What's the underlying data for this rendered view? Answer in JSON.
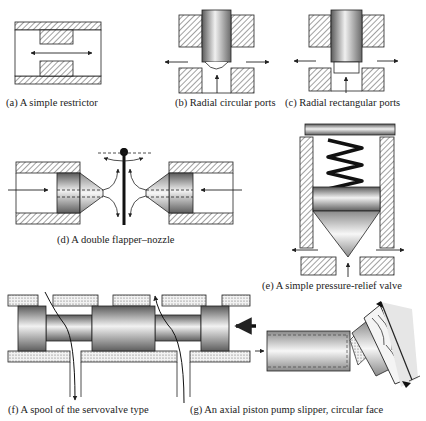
{
  "figure": {
    "panels": [
      {
        "id": "a",
        "caption": "(a) A simple restrictor"
      },
      {
        "id": "b",
        "caption": "(b) Radial circular ports"
      },
      {
        "id": "c",
        "caption": "(c) Radial rectangular ports"
      },
      {
        "id": "d",
        "caption": "(d) A double flapper–nozzle"
      },
      {
        "id": "e",
        "caption": "(e) A simple pressure-relief valve"
      },
      {
        "id": "f",
        "caption": "(f) A spool of the servovalve type"
      },
      {
        "id": "g",
        "caption": "(g) An axial piston pump slipper, circular face"
      }
    ]
  },
  "colors": {
    "line": "#222222",
    "hatch": "#555555",
    "metal_dark": "#6e6e6e",
    "metal_light": "#e8e8e8",
    "stipple": "#d8d8d8"
  }
}
